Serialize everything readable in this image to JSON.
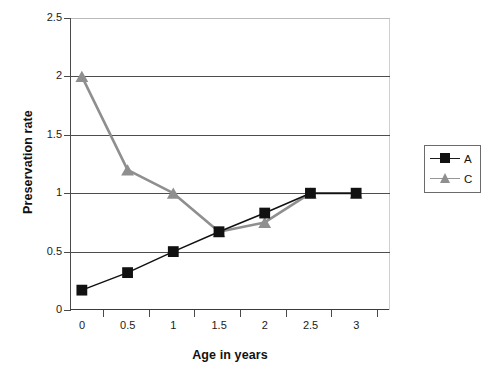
{
  "chart_data": {
    "type": "line",
    "title": "",
    "xlabel": "Age in years",
    "ylabel": "Preservation rate",
    "categories": [
      "0",
      "0.5",
      "1",
      "1.5",
      "2",
      "2.5",
      "3"
    ],
    "x": [
      0,
      0.5,
      1,
      1.5,
      2,
      2.5,
      3
    ],
    "series": [
      {
        "name": "A",
        "values": [
          0.17,
          0.32,
          0.5,
          0.67,
          0.83,
          1.0,
          1.0
        ],
        "color": "#111111",
        "marker": "square"
      },
      {
        "name": "C",
        "values": [
          2.0,
          1.2,
          1.0,
          0.67,
          0.75,
          1.0,
          1.0
        ],
        "color": "#8f8f8f",
        "marker": "triangle"
      }
    ],
    "ylim": [
      0,
      2.5
    ],
    "yticks": [
      "0",
      "0.5",
      "1",
      "1.5",
      "2",
      "2.5"
    ],
    "ytick_values": [
      0,
      0.5,
      1,
      1.5,
      2,
      2.5
    ],
    "xticks": [
      "0",
      "0.5",
      "1",
      "1.5",
      "2",
      "2.5",
      "3"
    ],
    "grid": true,
    "grid_axis": "y",
    "legend_position": "right"
  },
  "legend": {
    "entries": [
      {
        "label": "A"
      },
      {
        "label": "C"
      }
    ]
  },
  "axes": {
    "y_title": "Preservation rate",
    "x_title": "Age in years"
  }
}
